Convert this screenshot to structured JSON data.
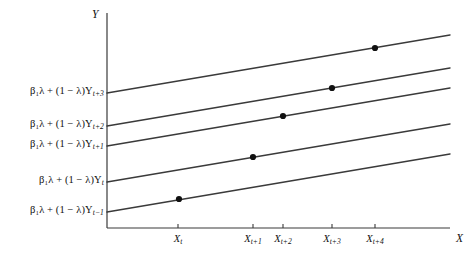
{
  "figure": {
    "type": "line-diagram",
    "axes": {
      "y_axis_name": "Y",
      "x_axis_name": "X",
      "y_axis_x_px": 107,
      "y_axis_top_px": 13,
      "x_axis_y_px": 228,
      "x_axis_right_px": 450,
      "line_color": "#3a3a3a",
      "text_color": "#101010",
      "point_color": "#111111"
    },
    "y_tick_labels": [
      {
        "id": "y-label-t+3",
        "text": "β₁λ + (1 − λ)Y",
        "sub": "t+3",
        "y_px": 93
      },
      {
        "id": "y-label-t+2",
        "text": "β₁λ + (1 − λ)Y",
        "sub": "t+2",
        "y_px": 126
      },
      {
        "id": "y-label-t+1",
        "text": "β₁λ + (1 − λ)Y",
        "sub": "t+1",
        "y_px": 146
      },
      {
        "id": "y-label-t",
        "text": "β₁λ + (1 − λ)Y",
        "sub": "t",
        "y_px": 182
      },
      {
        "id": "y-label-t-1",
        "text": "β₁λ + (1 − λ)Y",
        "sub": "t−1",
        "y_px": 212
      }
    ],
    "x_tick_labels": [
      {
        "id": "x-label-t",
        "text": "X",
        "sub": "t",
        "x_px": 178
      },
      {
        "id": "x-label-t+1",
        "text": "X",
        "sub": "t+1",
        "x_px": 253
      },
      {
        "id": "x-label-t+2",
        "text": "X",
        "sub": "t+2",
        "x_px": 283
      },
      {
        "id": "x-label-t+3",
        "text": "X",
        "sub": "t+3",
        "x_px": 332
      },
      {
        "id": "x-label-t+4",
        "text": "X",
        "sub": "t+4",
        "x_px": 375
      }
    ],
    "lines": [
      {
        "id": "line-1",
        "intercept_label": "y-label-t+3",
        "x1": 107,
        "y1": 93,
        "x2": 450,
        "y2": 35
      },
      {
        "id": "line-2",
        "intercept_label": "y-label-t+2",
        "x1": 107,
        "y1": 126,
        "x2": 450,
        "y2": 68
      },
      {
        "id": "line-3",
        "intercept_label": "y-label-t+1",
        "x1": 107,
        "y1": 146,
        "x2": 450,
        "y2": 88
      },
      {
        "id": "line-4",
        "intercept_label": "y-label-t",
        "x1": 107,
        "y1": 182,
        "x2": 450,
        "y2": 124
      },
      {
        "id": "line-5",
        "intercept_label": "y-label-t-1",
        "x1": 107,
        "y1": 212,
        "x2": 450,
        "y2": 154
      }
    ],
    "points": [
      {
        "id": "point-t-1",
        "on_line": "line-5",
        "at_x_tick": "x-label-t",
        "x_px": 179,
        "y_px": 199
      },
      {
        "id": "point-t",
        "on_line": "line-4",
        "at_x_tick": "x-label-t+1",
        "x_px": 253,
        "y_px": 157
      },
      {
        "id": "point-t+1",
        "on_line": "line-3",
        "at_x_tick": "x-label-t+2",
        "x_px": 283,
        "y_px": 116
      },
      {
        "id": "point-t+2",
        "on_line": "line-2",
        "at_x_tick": "x-label-t+3",
        "x_px": 332,
        "y_px": 88
      },
      {
        "id": "point-t+3",
        "on_line": "line-1",
        "at_x_tick": "x-label-t+4",
        "x_px": 375,
        "y_px": 48
      }
    ]
  },
  "chart_data": {
    "type": "line",
    "title": "",
    "xlabel": "X",
    "ylabel": "Y",
    "grid": false,
    "legend": "none",
    "categories": [
      "X_t",
      "X_{t+1}",
      "X_{t+2}",
      "X_{t+3}",
      "X_{t+4}"
    ],
    "series": [
      {
        "name": "β₁λ + (1−λ)Y_{t+3}",
        "intercept_px": 93,
        "slope_px_per_px": -0.169
      },
      {
        "name": "β₁λ + (1−λ)Y_{t+2}",
        "intercept_px": 126,
        "slope_px_per_px": -0.169
      },
      {
        "name": "β₁λ + (1−λ)Y_{t+1}",
        "intercept_px": 146,
        "slope_px_per_px": -0.169
      },
      {
        "name": "β₁λ + (1−λ)Y_{t}",
        "intercept_px": 182,
        "slope_px_per_px": -0.169
      },
      {
        "name": "β₁λ + (1−λ)Y_{t-1}",
        "intercept_px": 212,
        "slope_px_per_px": -0.169
      }
    ],
    "marked_points": [
      {
        "x": "X_t",
        "series": "β₁λ + (1−λ)Y_{t-1}"
      },
      {
        "x": "X_{t+1}",
        "series": "β₁λ + (1−λ)Y_{t}"
      },
      {
        "x": "X_{t+2}",
        "series": "β₁λ + (1−λ)Y_{t+1}"
      },
      {
        "x": "X_{t+3}",
        "series": "β₁λ + (1−λ)Y_{t+2}"
      },
      {
        "x": "X_{t+4}",
        "series": "β₁λ + (1−λ)Y_{t+3}"
      }
    ]
  }
}
